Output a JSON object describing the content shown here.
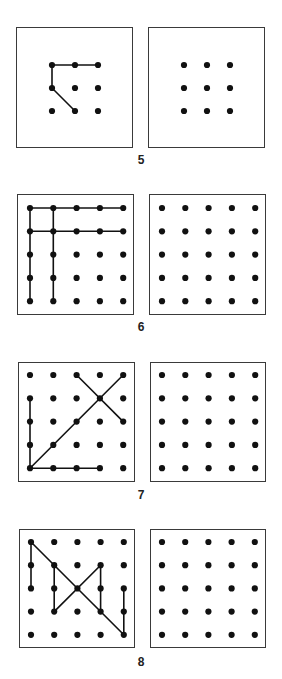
{
  "colors": {
    "ink": "#111111",
    "border": "#3a3a3a",
    "background": "#ffffff"
  },
  "panels": [
    {
      "number": "5",
      "grid_size": 3,
      "top": 27,
      "height": 121,
      "left_box": {
        "x": 16,
        "w": 117
      },
      "right_box": {
        "x": 148,
        "w": 117
      },
      "grid_origin": {
        "dx": 35,
        "dy": 37
      },
      "spacing": 23,
      "label_y": 153,
      "lines": [
        [
          [
            0,
            0
          ],
          [
            2,
            0
          ]
        ],
        [
          [
            0,
            0
          ],
          [
            0,
            1
          ]
        ],
        [
          [
            0,
            1
          ],
          [
            1,
            2
          ]
        ]
      ]
    },
    {
      "number": "6",
      "grid_size": 5,
      "top": 194,
      "height": 121,
      "left_box": {
        "x": 17,
        "w": 117
      },
      "right_box": {
        "x": 149,
        "w": 117
      },
      "grid_origin": {
        "dx": 12,
        "dy": 13
      },
      "spacing": 23.3,
      "label_y": 320,
      "lines": [
        [
          [
            0,
            0
          ],
          [
            4,
            0
          ]
        ],
        [
          [
            0,
            1
          ],
          [
            4,
            1
          ]
        ],
        [
          [
            0,
            0
          ],
          [
            0,
            4
          ]
        ],
        [
          [
            1,
            0
          ],
          [
            1,
            4
          ]
        ]
      ]
    },
    {
      "number": "7",
      "grid_size": 5,
      "top": 362,
      "height": 120,
      "left_box": {
        "x": 18,
        "w": 117
      },
      "right_box": {
        "x": 150,
        "w": 116
      },
      "grid_origin": {
        "dx": 11,
        "dy": 12
      },
      "spacing": 23.3,
      "label_y": 488,
      "lines": [
        [
          [
            0,
            1
          ],
          [
            0,
            4
          ]
        ],
        [
          [
            0,
            4
          ],
          [
            3,
            4
          ]
        ],
        [
          [
            0,
            4
          ],
          [
            4,
            0
          ]
        ],
        [
          [
            2,
            0
          ],
          [
            4,
            2
          ]
        ]
      ]
    },
    {
      "number": "8",
      "grid_size": 5,
      "top": 529,
      "height": 119,
      "left_box": {
        "x": 19,
        "w": 116
      },
      "right_box": {
        "x": 150,
        "w": 116
      },
      "grid_origin": {
        "dx": 11,
        "dy": 12
      },
      "spacing": 23.2,
      "label_y": 655,
      "lines": [
        [
          [
            0,
            0
          ],
          [
            0,
            2
          ]
        ],
        [
          [
            0,
            0
          ],
          [
            4,
            4
          ]
        ],
        [
          [
            1,
            1
          ],
          [
            1,
            3
          ]
        ],
        [
          [
            1,
            3
          ],
          [
            3,
            1
          ]
        ],
        [
          [
            3,
            1
          ],
          [
            3,
            3
          ]
        ],
        [
          [
            4,
            2
          ],
          [
            4,
            4
          ]
        ]
      ]
    }
  ]
}
